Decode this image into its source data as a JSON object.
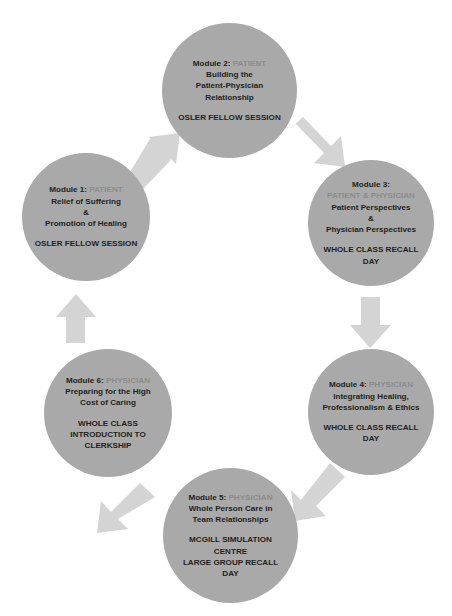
{
  "diagram": {
    "type": "cycle-diagram",
    "direction": "clockwise",
    "colors": {
      "node_fill": "#a9a9a9",
      "arrow_fill": "#d4d4d4",
      "text": "#231f20",
      "role_text": "#8c8c8c",
      "background": "#ffffff"
    },
    "watermark": "",
    "nodes": [
      {
        "id": "module-1",
        "module_label": "Module 1:",
        "role": "PATIENT",
        "description_lines": [
          "Relief of Suffering",
          "&",
          "Promotion of Healing"
        ],
        "session_lines": [
          "OSLER FELLOW SESSION"
        ]
      },
      {
        "id": "module-2",
        "module_label": "Module 2:",
        "role": "PATIENT",
        "description_lines": [
          "Building the",
          "Patient-Physician",
          "Relationship"
        ],
        "session_lines": [
          "OSLER FELLOW SESSION"
        ]
      },
      {
        "id": "module-3",
        "module_label": "Module 3:",
        "role": "PATIENT & PHYSICIAN",
        "description_lines": [
          "Patient Perspectives",
          "&",
          "Physician Perspectives"
        ],
        "session_lines": [
          "WHOLE CLASS RECALL",
          "DAY"
        ]
      },
      {
        "id": "module-4",
        "module_label": "Module 4:",
        "role": "PHYSICIAN",
        "description_lines": [
          "Integrating Healing,",
          "Professionalism & Ethics"
        ],
        "session_lines": [
          "WHOLE CLASS RECALL",
          "DAY"
        ]
      },
      {
        "id": "module-5",
        "module_label": "Module 5:",
        "role": "PHYSICIAN",
        "description_lines": [
          "Whole Person Care in",
          "Team Relationships"
        ],
        "session_lines": [
          "MCGILL SIMULATION",
          "CENTRE",
          "LARGE GROUP RECALL",
          "DAY"
        ]
      },
      {
        "id": "module-6",
        "module_label": "Module 6:",
        "role": "PHYSICIAN",
        "description_lines": [
          "Preparing for the High",
          "Cost of Caring"
        ],
        "session_lines": [
          "WHOLE CLASS",
          "INTRODUCTION TO",
          "CLERKSHIP"
        ]
      }
    ],
    "arrows": [
      {
        "id": "arrow-1-to-2",
        "from": "module-1",
        "to": "module-2",
        "direction": "up-right"
      },
      {
        "id": "arrow-2-to-3",
        "from": "module-2",
        "to": "module-3",
        "direction": "down-right"
      },
      {
        "id": "arrow-3-to-4",
        "from": "module-3",
        "to": "module-4",
        "direction": "down"
      },
      {
        "id": "arrow-4-to-5",
        "from": "module-4",
        "to": "module-5",
        "direction": "down-left"
      },
      {
        "id": "arrow-5-to-6",
        "from": "module-5",
        "to": "module-6",
        "direction": "up-left"
      },
      {
        "id": "arrow-6-to-1",
        "from": "module-6",
        "to": "module-1",
        "direction": "up"
      }
    ]
  }
}
